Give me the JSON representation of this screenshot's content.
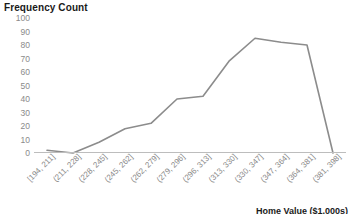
{
  "chart_data": {
    "type": "line",
    "title": "Frequency Count",
    "xlabel": "Home Value ($1,000s)",
    "ylabel": "",
    "categories": [
      "[194, 211]",
      "(211, 228]",
      "(228, 245]",
      "(245, 262]",
      "(262, 279]",
      "(279, 296]",
      "(296, 313]",
      "(313, 330]",
      "(330, 347]",
      "(347, 364]",
      "(364, 381]",
      "(381, 398]"
    ],
    "values": [
      2,
      0,
      8,
      18,
      22,
      40,
      42,
      68,
      85,
      82,
      80,
      0
    ],
    "ylim": [
      0,
      100
    ],
    "yticks": [
      0,
      10,
      20,
      30,
      40,
      50,
      60,
      70,
      80,
      90,
      100
    ],
    "ytick_labels": [
      "0",
      "10",
      "20",
      "30",
      "40",
      "50",
      "60",
      "70",
      "80",
      "90",
      "100"
    ],
    "grid": false,
    "legend": "none",
    "line_color": "#8c8c8c",
    "axis_color": "#bdbdbd",
    "tick_label_color": "#8a8a8a",
    "title_color": "#1a1a1a"
  }
}
